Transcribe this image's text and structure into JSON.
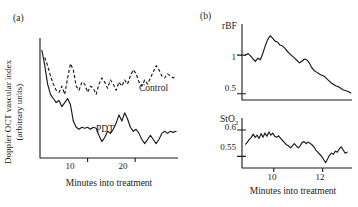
{
  "figure": {
    "panel_a_label": "(a)",
    "panel_b_label": "(b)"
  },
  "panel_a": {
    "ylabel_line1": "Doppler OCT vascular index",
    "ylabel_line2": "(arbitrary units)",
    "xlabel": "Minutes into treatment",
    "xticks": [
      "10",
      "20"
    ],
    "series_labels": {
      "control": "Control",
      "pdt": "PDT"
    }
  },
  "panel_b": {
    "xlabel": "Minutes into treatment",
    "xticks": [
      "10",
      "12"
    ],
    "rbf_title": "rBF",
    "rbf_yticks": [
      "1",
      "0.5"
    ],
    "sto2_title": "StO",
    "sto2_title_sub": "2",
    "sto2_yticks": [
      "0.6",
      "0.55"
    ]
  },
  "chart_data": [
    {
      "type": "line",
      "id": "panel-a",
      "title": "(a) Doppler OCT vascular index during treatment",
      "xlabel": "Minutes into treatment",
      "ylabel": "Doppler OCT vascular index (arbitrary units)",
      "xlim": [
        0,
        29
      ],
      "ylim": [
        0,
        1.15
      ],
      "xticks": [
        10,
        20
      ],
      "yticks": [],
      "grid": false,
      "legend": "inline-annotation",
      "series": [
        {
          "name": "Control",
          "style": "dashed",
          "x": [
            1.0,
            1.6,
            2.2,
            2.8,
            3.4,
            4.0,
            4.6,
            5.2,
            5.8,
            6.4,
            7.0,
            7.6,
            8.2,
            8.8,
            9.4,
            10.0,
            10.6,
            11.2,
            11.8,
            12.4,
            13.0,
            13.6,
            14.2,
            14.8,
            15.4,
            16.0,
            16.6,
            17.2,
            17.8,
            18.4,
            19.0,
            19.6,
            20.2,
            20.8,
            21.4,
            22.0,
            22.6,
            23.2,
            23.8,
            24.4,
            25.0,
            25.6,
            26.2,
            26.8,
            27.4,
            28.0,
            28.6
          ],
          "y": [
            0.98,
            0.9,
            0.8,
            0.72,
            0.66,
            0.64,
            0.7,
            0.62,
            0.78,
            0.92,
            0.86,
            0.7,
            0.66,
            0.74,
            0.72,
            0.64,
            0.7,
            0.68,
            0.62,
            0.72,
            0.78,
            0.74,
            0.68,
            0.76,
            0.72,
            0.66,
            0.74,
            0.7,
            0.76,
            0.72,
            0.8,
            0.86,
            0.82,
            0.74,
            0.7,
            0.76,
            0.72,
            0.78,
            0.84,
            0.9,
            0.86,
            0.8,
            0.78,
            0.82,
            0.8,
            0.78,
            0.8
          ]
        },
        {
          "name": "PDT",
          "style": "solid",
          "x": [
            0.4,
            1.0,
            1.6,
            2.2,
            2.8,
            3.4,
            4.0,
            4.6,
            5.2,
            5.8,
            6.4,
            7.0,
            7.6,
            8.2,
            8.8,
            9.4,
            10.0,
            10.6,
            11.2,
            11.8,
            12.4,
            13.0,
            13.6,
            14.2,
            14.8,
            15.4,
            16.0,
            16.6,
            17.2,
            17.8,
            18.4,
            19.0,
            19.6,
            20.2,
            20.8,
            21.4,
            22.0,
            22.6,
            23.2,
            23.8,
            24.4,
            25.0,
            25.6,
            26.2,
            26.8,
            27.4,
            28.0,
            28.6
          ],
          "y": [
            1.05,
            0.9,
            0.72,
            0.62,
            0.58,
            0.54,
            0.56,
            0.5,
            0.54,
            0.58,
            0.52,
            0.36,
            0.3,
            0.28,
            0.3,
            0.29,
            0.3,
            0.28,
            0.3,
            0.29,
            0.22,
            0.16,
            0.2,
            0.26,
            0.24,
            0.28,
            0.34,
            0.42,
            0.36,
            0.44,
            0.38,
            0.3,
            0.26,
            0.28,
            0.24,
            0.18,
            0.14,
            0.18,
            0.22,
            0.18,
            0.14,
            0.18,
            0.24,
            0.26,
            0.24,
            0.26,
            0.25,
            0.26
          ]
        }
      ]
    },
    {
      "type": "line",
      "id": "panel-b-rbf",
      "title": "rBF",
      "xlabel": "Minutes into treatment",
      "ylabel": "rBF",
      "xlim": [
        8.7,
        13.2
      ],
      "ylim": [
        0.42,
        1.35
      ],
      "xticks": [
        10,
        12
      ],
      "yticks": [
        0.5,
        1
      ],
      "grid": false,
      "series": [
        {
          "name": "rBF",
          "style": "solid",
          "x": [
            8.85,
            8.95,
            9.05,
            9.15,
            9.25,
            9.35,
            9.45,
            9.55,
            9.65,
            9.75,
            9.85,
            9.95,
            10.05,
            10.15,
            10.25,
            10.35,
            10.45,
            10.55,
            10.65,
            10.75,
            10.85,
            10.95,
            11.05,
            11.15,
            11.25,
            11.35,
            11.45,
            11.55,
            11.65,
            11.75,
            11.85,
            11.95,
            12.05,
            12.15,
            12.25,
            12.35,
            12.45,
            12.55,
            12.65,
            12.75,
            12.85,
            12.95,
            13.05,
            13.15
          ],
          "y": [
            1.0,
            1.02,
            0.99,
            0.95,
            0.92,
            0.96,
            0.94,
            1.02,
            1.12,
            1.2,
            1.25,
            1.22,
            1.18,
            1.17,
            1.13,
            1.12,
            1.09,
            1.05,
            1.02,
            0.99,
            0.96,
            0.93,
            0.9,
            0.92,
            0.95,
            0.94,
            0.9,
            0.84,
            0.8,
            0.78,
            0.76,
            0.74,
            0.73,
            0.7,
            0.67,
            0.64,
            0.62,
            0.6,
            0.59,
            0.57,
            0.55,
            0.54,
            0.53,
            0.51
          ]
        }
      ]
    },
    {
      "type": "line",
      "id": "panel-b-sto2",
      "title": "StO2",
      "xlabel": "Minutes into treatment",
      "ylabel": "StO2",
      "xlim": [
        8.7,
        13.2
      ],
      "ylim": [
        0.528,
        0.615
      ],
      "xticks": [
        10,
        12
      ],
      "yticks": [
        0.55,
        0.6
      ],
      "grid": false,
      "series": [
        {
          "name": "StO2",
          "style": "solid",
          "x": [
            8.85,
            8.92,
            9.0,
            9.08,
            9.16,
            9.24,
            9.32,
            9.4,
            9.48,
            9.56,
            9.64,
            9.72,
            9.8,
            9.88,
            9.96,
            10.04,
            10.12,
            10.2,
            10.28,
            10.36,
            10.44,
            10.52,
            10.6,
            10.68,
            10.76,
            10.84,
            10.92,
            11.0,
            11.08,
            11.16,
            11.24,
            11.32,
            11.4,
            11.48,
            11.56,
            11.64,
            11.72,
            11.8,
            11.88,
            11.96,
            12.04,
            12.12,
            12.2,
            12.28,
            12.36,
            12.44,
            12.52,
            12.6,
            12.68,
            12.76,
            12.84,
            12.92,
            13.0
          ],
          "y": [
            0.573,
            0.577,
            0.582,
            0.586,
            0.592,
            0.586,
            0.59,
            0.584,
            0.593,
            0.586,
            0.594,
            0.588,
            0.596,
            0.59,
            0.594,
            0.588,
            0.586,
            0.589,
            0.584,
            0.58,
            0.576,
            0.572,
            0.57,
            0.566,
            0.57,
            0.574,
            0.57,
            0.566,
            0.57,
            0.576,
            0.578,
            0.574,
            0.577,
            0.575,
            0.572,
            0.568,
            0.562,
            0.558,
            0.554,
            0.55,
            0.544,
            0.538,
            0.545,
            0.552,
            0.556,
            0.554,
            0.56,
            0.558,
            0.564,
            0.568,
            0.562,
            0.556,
            0.558
          ]
        }
      ]
    }
  ]
}
